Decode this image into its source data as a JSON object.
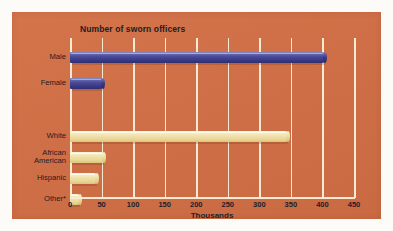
{
  "chart_data": {
    "type": "bar",
    "orientation": "horizontal",
    "title": "Number of sworn officers",
    "subtitle": "",
    "xlabel": "Thousands",
    "ylabel": "",
    "xlim": [
      0,
      450
    ],
    "xticks": [
      0,
      50,
      100,
      150,
      200,
      250,
      300,
      350,
      400,
      450
    ],
    "xtick_labels": [
      "0",
      "50",
      "100",
      "150",
      "200",
      "250",
      "300",
      "350",
      "400",
      "450"
    ],
    "grid": "vertical",
    "legend": "none",
    "groups": [
      {
        "name": "sex",
        "color": "#4a4a9a",
        "categories": [
          "Male",
          "Female"
        ],
        "values": [
          404,
          53
        ]
      },
      {
        "name": "raceEthnicity",
        "color": "#efe1a9",
        "categories": [
          "White",
          "African American",
          "Hispanic",
          "Other*"
        ],
        "values": [
          345,
          54,
          43,
          16
        ]
      }
    ],
    "bars": [
      {
        "label": "Male",
        "value": 404,
        "series": "sex",
        "color": "#4a4a9a"
      },
      {
        "label": "Female",
        "value": 53,
        "series": "sex",
        "color": "#4a4a9a"
      },
      {
        "label": "White",
        "value": 345,
        "series": "raceEthnicity",
        "color": "#efe1a9"
      },
      {
        "label": "African American",
        "value": 54,
        "series": "raceEthnicity",
        "color": "#efe1a9"
      },
      {
        "label": "Hispanic",
        "value": 43,
        "series": "raceEthnicity",
        "color": "#efe1a9"
      },
      {
        "label": "Other*",
        "value": 16,
        "series": "raceEthnicity",
        "color": "#efe1a9"
      }
    ],
    "annotations": [
      "Other* denotes remaining race/ethnicity categories"
    ],
    "colors": {
      "background": "#d3724a",
      "page": "#fdfbf8",
      "gridline": "#f6ead2",
      "bar_blue": "#4a4a9a",
      "bar_cream": "#efe1a9",
      "text": "#1c1c24"
    }
  },
  "category_labels": [
    {
      "lines": [
        "Male"
      ]
    },
    {
      "lines": [
        "Female"
      ]
    },
    {
      "lines": [
        "White"
      ]
    },
    {
      "lines": [
        "African",
        "American"
      ]
    },
    {
      "lines": [
        "Hispanic"
      ]
    },
    {
      "lines": [
        "Other*"
      ]
    }
  ]
}
